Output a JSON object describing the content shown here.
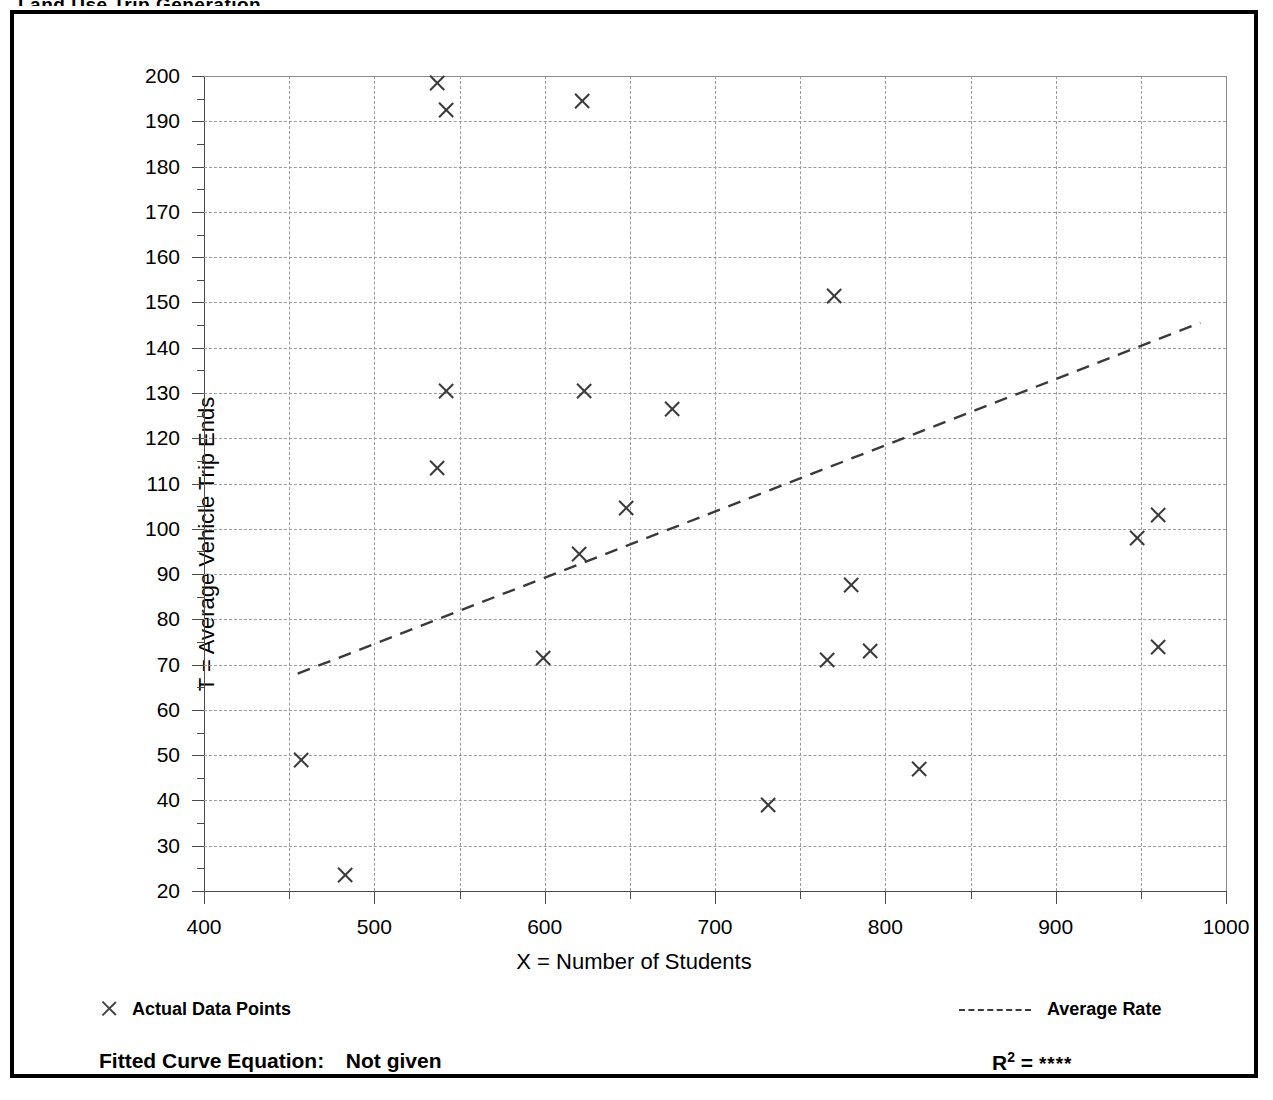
{
  "frame": {
    "cropped_title_fragment": "Land Use Trip Generation"
  },
  "axis": {
    "x_title": "X = Number of Students",
    "y_title": "T = Average Vehicle Trip Ends",
    "x_ticks": [
      "400",
      "500",
      "600",
      "700",
      "800",
      "900",
      "1000"
    ],
    "y_ticks": [
      "200",
      "190",
      "180",
      "170",
      "160",
      "150",
      "140",
      "130",
      "120",
      "110",
      "100",
      "90",
      "80",
      "70",
      "60",
      "50",
      "40",
      "30",
      "20"
    ]
  },
  "legend": {
    "points_marker": "x-cross-icon",
    "points_label": "Actual Data Points",
    "line_marker": "dashed-line-icon",
    "line_label": "Average Rate"
  },
  "footer": {
    "equation_label": "Fitted Curve Equation:",
    "equation_value": "Not given",
    "r2_label": "R",
    "r2_exponent": "2",
    "r2_equals": "=",
    "r2_value": "****"
  },
  "colors": {
    "frame_border": "#000000",
    "grid": "#9a9a9a",
    "axis": "#4a4a4a",
    "marker": "#3a3a3a",
    "trend_line": "#3a3a3a",
    "text": "#000000"
  },
  "chart_data": {
    "type": "scatter",
    "title": "",
    "xlabel": "X = Number of Students",
    "ylabel": "T = Average Vehicle Trip Ends",
    "xlim": [
      400,
      1000
    ],
    "ylim": [
      20,
      200
    ],
    "x_major_step": 100,
    "x_minor_step": 50,
    "y_major_step": 10,
    "y_minor_step": 5,
    "grid": true,
    "legend_position": "below-axes",
    "series": [
      {
        "name": "Actual Data Points",
        "marker": "x",
        "points": [
          [
            537,
            198.5
          ],
          [
            542,
            192.5
          ],
          [
            622,
            194.5
          ],
          [
            770,
            151.5
          ],
          [
            542,
            130.5
          ],
          [
            623,
            130.5
          ],
          [
            675,
            126.5
          ],
          [
            537,
            113.5
          ],
          [
            648,
            104.5
          ],
          [
            960,
            103.0
          ],
          [
            948,
            98.0
          ],
          [
            620,
            94.5
          ],
          [
            780,
            87.5
          ],
          [
            960,
            74.0
          ],
          [
            791,
            73.0
          ],
          [
            599,
            71.5
          ],
          [
            766,
            71.0
          ],
          [
            457,
            49.0
          ],
          [
            820,
            47.0
          ],
          [
            731,
            39.0
          ],
          [
            483,
            23.5
          ]
        ]
      },
      {
        "name": "Average Rate",
        "type": "line",
        "style": "dashed",
        "endpoints": [
          [
            455,
            68.0
          ],
          [
            985,
            145.5
          ]
        ]
      }
    ],
    "annotations": {
      "fitted_curve_equation": "Not given",
      "r_squared": "****"
    }
  }
}
